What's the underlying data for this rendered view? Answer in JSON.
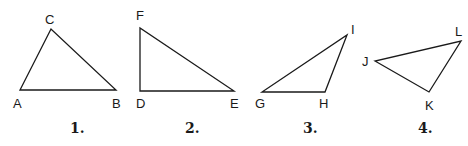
{
  "figure": {
    "width": 468,
    "height": 146,
    "background": "#ffffff",
    "stroke_color": "#1a1a1a",
    "triangles": [
      {
        "number_label": "1.",
        "number_pos": [
          70,
          133
        ],
        "vertices": [
          {
            "name": "A",
            "x": 20,
            "y": 90,
            "label_x": 13,
            "label_y": 108
          },
          {
            "name": "B",
            "x": 116,
            "y": 90,
            "label_x": 112,
            "label_y": 108
          },
          {
            "name": "C",
            "x": 51,
            "y": 29,
            "label_x": 45,
            "label_y": 24
          }
        ]
      },
      {
        "number_label": "2.",
        "number_pos": [
          185,
          133
        ],
        "vertices": [
          {
            "name": "D",
            "x": 140,
            "y": 91,
            "label_x": 136,
            "label_y": 108
          },
          {
            "name": "E",
            "x": 234,
            "y": 91,
            "label_x": 230,
            "label_y": 108
          },
          {
            "name": "F",
            "x": 140,
            "y": 28,
            "label_x": 136,
            "label_y": 20
          }
        ]
      },
      {
        "number_label": "3.",
        "number_pos": [
          303,
          133
        ],
        "vertices": [
          {
            "name": "G",
            "x": 262,
            "y": 92,
            "label_x": 255,
            "label_y": 108
          },
          {
            "name": "H",
            "x": 325,
            "y": 92,
            "label_x": 319,
            "label_y": 108
          },
          {
            "name": "I",
            "x": 347,
            "y": 35,
            "label_x": 351,
            "label_y": 34
          }
        ]
      },
      {
        "number_label": "4.",
        "number_pos": [
          418,
          133
        ],
        "vertices": [
          {
            "name": "J",
            "x": 375,
            "y": 61,
            "label_x": 362,
            "label_y": 66
          },
          {
            "name": "K",
            "x": 429,
            "y": 92,
            "label_x": 425,
            "label_y": 110
          },
          {
            "name": "L",
            "x": 461,
            "y": 41,
            "label_x": 455,
            "label_y": 36
          }
        ]
      }
    ]
  }
}
